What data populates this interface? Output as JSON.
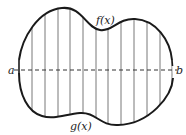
{
  "diagram": {
    "labels": {
      "left_endpoint": "a",
      "right_endpoint": "b",
      "upper_curve": "f(x)",
      "lower_curve": "g(x)"
    },
    "colors": {
      "curve": "#1a1a1a",
      "strip_lines": "#555555",
      "axis_dashed": "#333333",
      "background": "#ffffff"
    },
    "strip_count": 12,
    "strip_x_positions": [
      32,
      45,
      58,
      70,
      83,
      96,
      108,
      121,
      134,
      147,
      160,
      172
    ]
  }
}
